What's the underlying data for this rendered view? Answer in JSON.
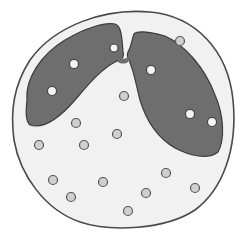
{
  "figure": {
    "colors": {
      "background": "#ffffff",
      "cytoplasm": "#f1f1f1",
      "outline": "#4a4a4a",
      "nucleus": "#6e6e6e",
      "nucleus_outline": "#3c3c3c",
      "granule_fill": "#cfcfcf",
      "granule_outline": "#555555",
      "nucleus_granule_fill": "#f4f4f4"
    },
    "cell": {
      "cx": 123,
      "cy": 119,
      "rx": 110,
      "ry": 109
    },
    "nucleus_granules": [
      {
        "x": 114,
        "y": 48,
        "r": 4
      },
      {
        "x": 74,
        "y": 64,
        "r": 4.5
      },
      {
        "x": 52,
        "y": 91,
        "r": 4.5
      },
      {
        "x": 151,
        "y": 70,
        "r": 4.5
      },
      {
        "x": 190,
        "y": 114,
        "r": 4.5
      },
      {
        "x": 212,
        "y": 122,
        "r": 4.5
      }
    ],
    "cytoplasm_granules": [
      {
        "x": 180,
        "y": 41
      },
      {
        "x": 124,
        "y": 96
      },
      {
        "x": 76,
        "y": 123
      },
      {
        "x": 117,
        "y": 134
      },
      {
        "x": 39,
        "y": 145
      },
      {
        "x": 84,
        "y": 145
      },
      {
        "x": 166,
        "y": 173
      },
      {
        "x": 53,
        "y": 180
      },
      {
        "x": 103,
        "y": 182
      },
      {
        "x": 146,
        "y": 193
      },
      {
        "x": 195,
        "y": 188
      },
      {
        "x": 71,
        "y": 197
      },
      {
        "x": 128,
        "y": 211
      }
    ]
  }
}
